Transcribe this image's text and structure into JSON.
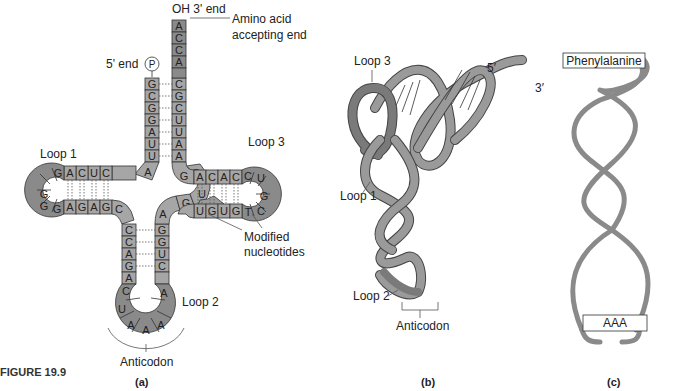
{
  "figure": {
    "number_label": "FIGURE 19.9",
    "panels": [
      {
        "id": "a",
        "caption": "(a)"
      },
      {
        "id": "b",
        "caption": "(b)"
      },
      {
        "id": "c",
        "caption": "(c)"
      }
    ]
  },
  "panel_a": {
    "labels": {
      "three_prime": "OH 3' end",
      "amino_acid_end": "Amino acid",
      "amino_acid_end_2": "accepting end",
      "five_prime": "5' end",
      "phosphate": "P",
      "loop1": "Loop 1",
      "loop2": "Loop 2",
      "loop3": "Loop 3",
      "modified": "Modified",
      "modified_2": "nucleotides",
      "anticodon": "Anticodon"
    },
    "acceptor_stem_5prime": [
      "G",
      "C",
      "G",
      "G",
      "A",
      "U",
      "U"
    ],
    "acceptor_stem_3prime": [
      "A",
      "C",
      "C",
      "A",
      "C",
      "G",
      "C",
      "U",
      "U",
      "A",
      "A"
    ],
    "junction_nt": "A",
    "d_stem_top": [
      "A",
      "C",
      "U",
      "C"
    ],
    "d_loop": [
      "G",
      "G",
      "G",
      "G"
    ],
    "d_stem_bottom": [
      "A",
      "G",
      "A",
      "G",
      "C"
    ],
    "t_stem_top": [
      "G",
      "A",
      "C",
      "A",
      "C"
    ],
    "t_loop": [
      "C",
      "U",
      "G",
      "C",
      "T"
    ],
    "t_stem_bottom": [
      "U",
      "G",
      "U",
      "G"
    ],
    "variable_loop": [
      "A",
      "G",
      "C",
      "U"
    ],
    "anticodon_stem_left": [
      "C",
      "C",
      "A",
      "G",
      "A"
    ],
    "anticodon_stem_right": [
      "G",
      "G",
      "U",
      "C"
    ],
    "anticodon_loop": [
      "C",
      "U",
      "A",
      "A",
      "A",
      "A"
    ]
  },
  "panel_b": {
    "labels": {
      "loop3": "Loop 3",
      "loop1": "Loop 1",
      "loop2": "Loop 2",
      "five_prime": "5′",
      "three_prime": "3′",
      "anticodon": "Anticodon"
    }
  },
  "panel_c": {
    "labels": {
      "amino_acid": "Phenylalanine",
      "anticodon": "AAA"
    }
  },
  "colors": {
    "nucleotide_fill": "#a6a6a6",
    "loop_fill": "#8a8a8a",
    "outline": "#333333",
    "tube": "#9a9a9a"
  }
}
